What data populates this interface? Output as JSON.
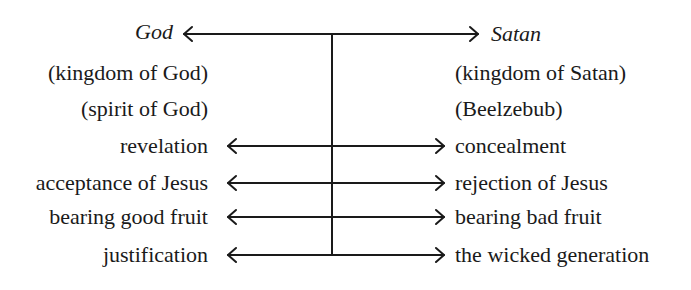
{
  "diagram": {
    "type": "opposition-diagram",
    "poles": {
      "left": "God",
      "right": "Satan"
    },
    "left_column": [
      "(kingdom of God)",
      "(spirit of God)",
      "revelation",
      "acceptance of Jesus",
      "bearing good fruit",
      "justification"
    ],
    "right_column": [
      "(kingdom of Satan)",
      "(Beelzebub)",
      "concealment",
      "rejection of Jesus",
      "bearing bad fruit",
      "the wicked generation"
    ],
    "arrow_pairs": [
      {
        "left": "God",
        "right": "Satan"
      },
      {
        "left": "revelation",
        "right": "concealment"
      },
      {
        "left": "acceptance of Jesus",
        "right": "rejection of Jesus"
      },
      {
        "left": "bearing good fruit",
        "right": "bearing bad fruit"
      },
      {
        "left": "justification",
        "right": "the wicked generation"
      }
    ],
    "colors": {
      "ink": "#1a1a1a",
      "background": "#ffffff"
    }
  }
}
